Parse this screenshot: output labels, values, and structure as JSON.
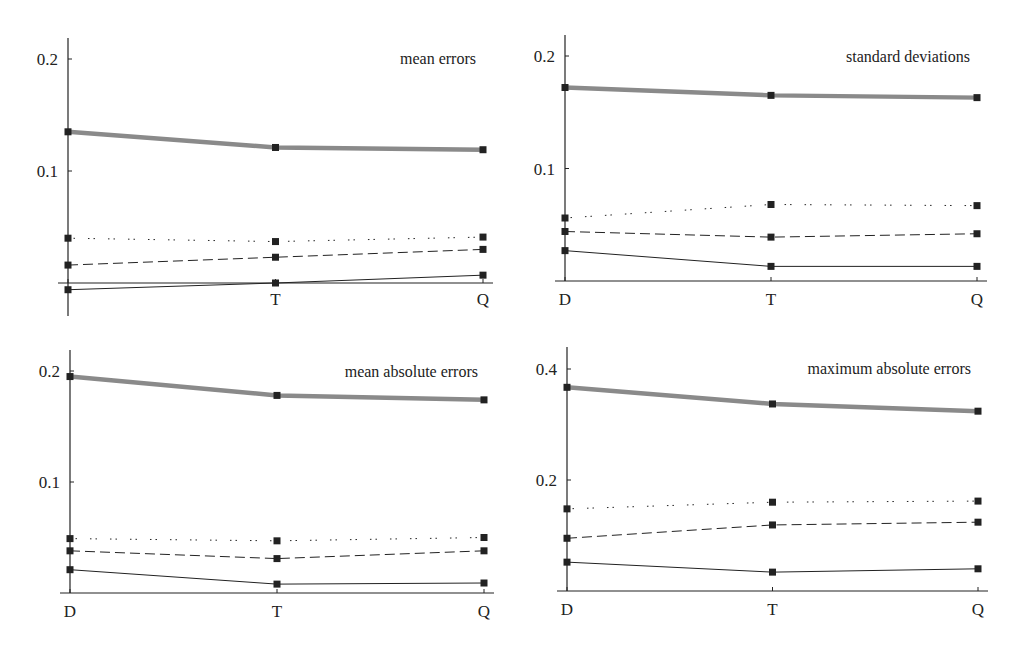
{
  "chart_data": [
    {
      "type": "line",
      "title": "mean errors",
      "categories": [
        "D",
        "T",
        "Q"
      ],
      "x_tick_labels": [
        "",
        "T",
        "Q"
      ],
      "yticks": [
        0.1,
        0.2
      ],
      "ytick_labels": [
        "0.1",
        "0.2"
      ],
      "ylim": [
        -0.03,
        0.22
      ],
      "xlabel": "",
      "ylabel": "",
      "grid": false,
      "series": [
        {
          "name": "thick gray",
          "style": "thick-gray",
          "values": [
            0.135,
            0.121,
            0.119
          ]
        },
        {
          "name": "dotted",
          "style": "dotted",
          "values": [
            0.04,
            0.037,
            0.041
          ]
        },
        {
          "name": "dashed",
          "style": "dashed",
          "values": [
            0.016,
            0.023,
            0.03
          ]
        },
        {
          "name": "solid",
          "style": "solid",
          "values": [
            -0.006,
            0.0,
            0.007
          ]
        }
      ]
    },
    {
      "type": "line",
      "title": "standard deviations",
      "categories": [
        "D",
        "T",
        "Q"
      ],
      "x_tick_labels": [
        "D",
        "T",
        "Q"
      ],
      "yticks": [
        0.1,
        0.2
      ],
      "ytick_labels": [
        "0.1",
        "0.2"
      ],
      "ylim": [
        0,
        0.22
      ],
      "xlabel": "",
      "ylabel": "",
      "grid": false,
      "series": [
        {
          "name": "thick gray",
          "style": "thick-gray",
          "values": [
            0.172,
            0.165,
            0.163
          ]
        },
        {
          "name": "dotted",
          "style": "dotted",
          "values": [
            0.056,
            0.068,
            0.067
          ]
        },
        {
          "name": "dashed",
          "style": "dashed",
          "values": [
            0.044,
            0.039,
            0.042
          ]
        },
        {
          "name": "solid",
          "style": "solid",
          "values": [
            0.027,
            0.013,
            0.013
          ]
        }
      ]
    },
    {
      "type": "line",
      "title": "mean absolute errors",
      "categories": [
        "D",
        "T",
        "Q"
      ],
      "x_tick_labels": [
        "D",
        "T",
        "Q"
      ],
      "yticks": [
        0.1,
        0.2
      ],
      "ytick_labels": [
        "0.1",
        "0.2"
      ],
      "ylim": [
        0,
        0.22
      ],
      "xlabel": "",
      "ylabel": "",
      "grid": false,
      "series": [
        {
          "name": "thick gray",
          "style": "thick-gray",
          "values": [
            0.195,
            0.178,
            0.174
          ]
        },
        {
          "name": "dotted",
          "style": "dotted",
          "values": [
            0.049,
            0.047,
            0.05
          ]
        },
        {
          "name": "dashed",
          "style": "dashed",
          "values": [
            0.038,
            0.031,
            0.038
          ]
        },
        {
          "name": "solid",
          "style": "solid",
          "values": [
            0.021,
            0.008,
            0.009
          ]
        }
      ]
    },
    {
      "type": "line",
      "title": "maximum absolute errors",
      "categories": [
        "D",
        "T",
        "Q"
      ],
      "x_tick_labels": [
        "D",
        "T",
        "Q"
      ],
      "yticks": [
        0.2,
        0.4
      ],
      "ytick_labels": [
        "0.2",
        "0.4"
      ],
      "ylim": [
        0,
        0.44
      ],
      "xlabel": "",
      "ylabel": "",
      "grid": false,
      "series": [
        {
          "name": "thick gray",
          "style": "thick-gray",
          "values": [
            0.367,
            0.337,
            0.324
          ]
        },
        {
          "name": "dotted",
          "style": "dotted",
          "values": [
            0.148,
            0.16,
            0.162
          ]
        },
        {
          "name": "dashed",
          "style": "dashed",
          "values": [
            0.095,
            0.119,
            0.124
          ]
        },
        {
          "name": "solid",
          "style": "solid",
          "values": [
            0.052,
            0.034,
            0.04
          ]
        }
      ]
    }
  ],
  "layout": {
    "panels": [
      {
        "x0": 68,
        "x1": 483,
        "zero_y": 283,
        "px_per_unit": 1120,
        "axis_top": 38,
        "axis_bottom": 316,
        "title_x": 476,
        "title_y": 64,
        "label_y": 305
      },
      {
        "x0": 565,
        "x1": 977,
        "zero_y": 281,
        "px_per_unit": 1125,
        "axis_top": 35,
        "axis_bottom": 281,
        "title_x": 970,
        "title_y": 62,
        "label_y": 305
      },
      {
        "x0": 70,
        "x1": 484,
        "zero_y": 593,
        "px_per_unit": 1110,
        "axis_top": 350,
        "axis_bottom": 593,
        "title_x": 478,
        "title_y": 377,
        "label_y": 617
      },
      {
        "x0": 567,
        "x1": 978,
        "zero_y": 591,
        "px_per_unit": 555,
        "axis_top": 347,
        "axis_bottom": 591,
        "title_x": 971,
        "title_y": 374,
        "label_y": 615
      }
    ],
    "colors": {
      "ink": "#222222",
      "gray_band": "#8a8a8a"
    }
  }
}
